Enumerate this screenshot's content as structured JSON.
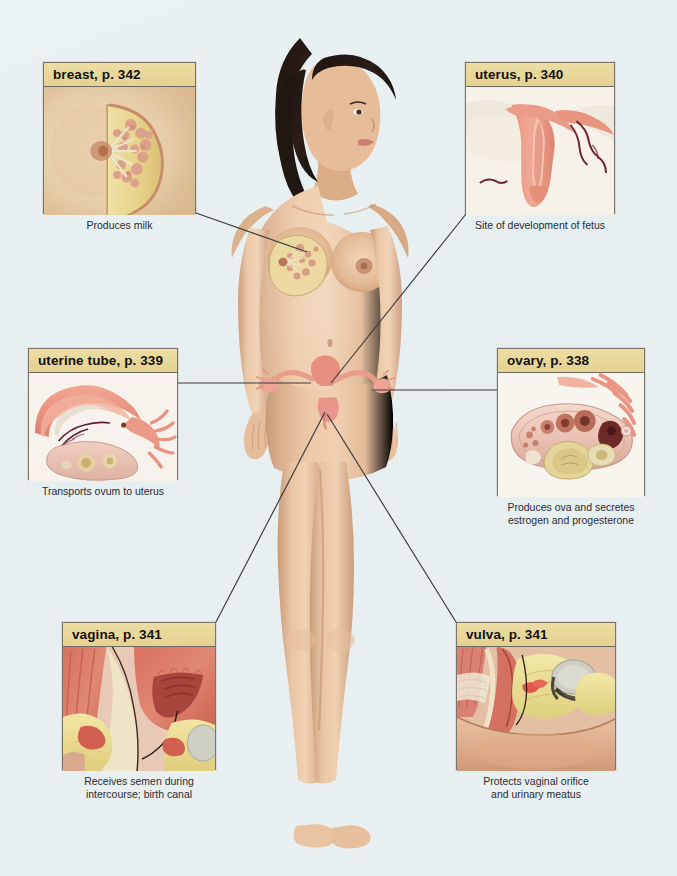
{
  "page": {
    "background_color": "#e9f0f1"
  },
  "style": {
    "label_bar_color": "#e9d79a",
    "box_border_color": "#7b7468",
    "leader_line_color": "#3a3a3c",
    "caption_color": "#2b2b30"
  },
  "callouts": [
    {
      "id": "breast",
      "label": "breast, p. 342",
      "caption": "Produces milk",
      "page_ref": "342",
      "art": "breast-sagittal-cutaway"
    },
    {
      "id": "uterus",
      "label": "uterus, p. 340",
      "caption": "Site of development of fetus",
      "page_ref": "340",
      "art": "uterus-coronal-section"
    },
    {
      "id": "uterine-tube",
      "label": "uterine tube, p. 339",
      "caption": "Transports ovum to uterus",
      "page_ref": "339",
      "art": "uterine-tube-with-fimbriae"
    },
    {
      "id": "ovary",
      "label": "ovary, p. 338",
      "caption": "Produces ova and secretes\nestrogen and progesterone",
      "page_ref": "338",
      "art": "ovary-follicle-section"
    },
    {
      "id": "vagina",
      "label": "vagina, p. 341",
      "caption": "Receives semen during\nintercourse; birth canal",
      "page_ref": "341",
      "art": "vagina-sagittal-section"
    },
    {
      "id": "vulva",
      "label": "vulva, p. 341",
      "caption": "Protects vaginal orifice\nand urinary meatus",
      "page_ref": "341",
      "art": "vulva-sagittal-section"
    }
  ],
  "figure": {
    "name": "standing-female-figure",
    "overlay": "pelvic-reproductive-organ-overlay"
  }
}
